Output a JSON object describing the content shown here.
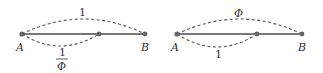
{
  "diagrams": [
    {
      "point_start": "A",
      "point_end": "B",
      "top_arc_label": "1",
      "bottom_arc_label_numerator": "1",
      "bottom_arc_label_denominator": "Φ"
    },
    {
      "point_start": "A",
      "point_end": "B",
      "top_arc_label": "Φ",
      "bottom_arc_label": "1"
    }
  ]
}
